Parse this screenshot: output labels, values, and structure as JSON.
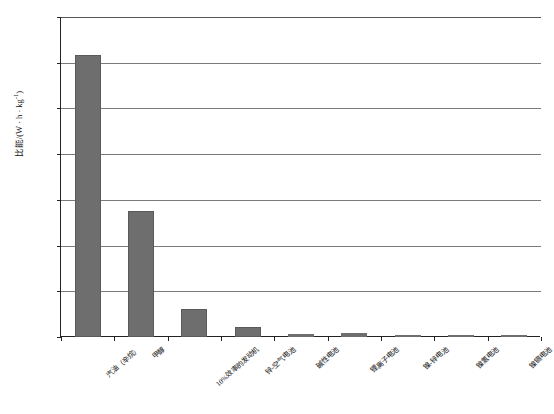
{
  "chart_data": {
    "type": "bar",
    "title": "",
    "xlabel": "",
    "ylabel": "比能/(W·h·kg-1)",
    "ylabel_base": "比能/(W · h · kg",
    "ylabel_exp": "-1",
    "ylabel_tail": ")",
    "ylim": [
      0,
      14000
    ],
    "grid": true,
    "legend": "none",
    "categories": [
      "汽油（辛烷）",
      "甲醇",
      "10%效率的发动机",
      "锌-空气电池",
      "碱性电池",
      "锂离子电池",
      "镍-锌电池",
      "镍氢电池",
      "镍镉电池"
    ],
    "values": [
      12350,
      5500,
      1230,
      430,
      150,
      160,
      70,
      30,
      30
    ],
    "ytick_labels": [
      "0",
      "2 000",
      "4 000",
      "6 000",
      "8 000",
      "10 000",
      "12 000",
      "14 000"
    ],
    "ytick_values": [
      0,
      2000,
      4000,
      6000,
      8000,
      10000,
      12000,
      14000
    ],
    "bar_color": "#6e6e6e",
    "grid_color": "#7b7b7b",
    "axis_color": "#222222"
  },
  "figure": {
    "caption": ""
  }
}
